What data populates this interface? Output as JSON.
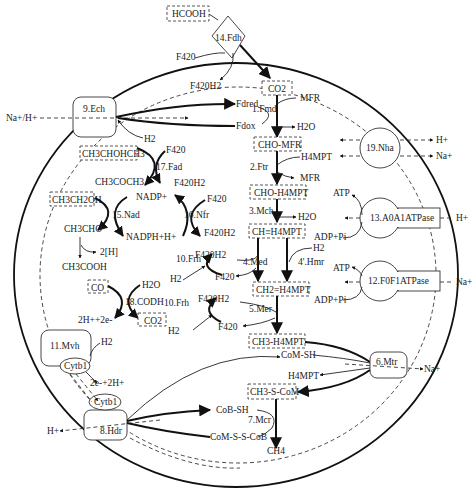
{
  "diagram": {
    "colors": {
      "line": "#111111",
      "text": "#222222",
      "background": "#ffffff"
    },
    "substrates": {
      "hcooh": "HCOOH",
      "co2_top": "CO2",
      "isopropanol": "CH3CHOHCH3",
      "ethanol": "CH3CH2OH",
      "co": "CO",
      "co2_codh": "CO2"
    },
    "enzymes": {
      "fdh": "14.Fdh",
      "ech": "9.Ech",
      "fmd": "1.Fmd",
      "ftr": "2.Ftr",
      "mch": "3.Mch",
      "med": "4.Med",
      "hmr": "4'.Hmr",
      "mer": "5.Mer",
      "mtr": "6.Mtr",
      "mcr": "7.Mcr",
      "hdr": "8.Hdr",
      "frh1": "10.Frh",
      "frh2": "10.Frh",
      "frh3": "10.Frh",
      "mvh": "11.Mvh",
      "f0f1": "12.F0F1ATPase",
      "a0a1": "13.A0A1ATPase",
      "nad": "15.Nad",
      "nfr": "16.Nfr",
      "fad": "17.Fad",
      "codh": "18.CODH",
      "nha": "19.Nha",
      "cytb_top": "Cytb1",
      "cytb_bottom": "Cytb1"
    },
    "intermediates": {
      "cho_mfr": "CHO-MFR",
      "cho_h4mpt": "CHO-H4MPT",
      "ch_h4mpt": "CH≡H4MPT",
      "ch2_h4mpt": "CH2=H4MPT",
      "ch3_h4mpt": "CH3-H4MPT",
      "ch3_s_com": "CH3-S-CoM",
      "ch4": "CH4"
    },
    "labels": {
      "f420_fdh": "F420",
      "f420h2_fdh": "F420H2",
      "fd_red": "Fdred",
      "fd_ox": "Fdox",
      "mfr_in": "MFR",
      "h2o_1": "H2O",
      "h4mpt_in": "H4MPT",
      "mfr_out": "MFR",
      "h2o_3": "H2O",
      "na_h": "Na+/H+",
      "h2_ech": "H2",
      "f420_fad": "F420",
      "f420h2_fad": "F420H2",
      "acetone": "CH3COCH3",
      "nadp": "NADP+",
      "f420_nfr": "F420",
      "f420h2_nfr": "F420H2",
      "acetaldehyde": "CH3CHO",
      "nadph": "NADPH+H+",
      "two_h": "2[H]",
      "acetate": "CH3COOH",
      "h2o_codh": "H2O",
      "electrons": "2H++2e-",
      "f420h2_frh1": "F420H2",
      "f420_frh1": "F420",
      "h2_frh1": "H2",
      "h2_hmr": "H2",
      "f420h2_frh2": "F420H2",
      "f420_frh2": "F420",
      "h2_frh2": "H2",
      "h2_mvh": "H2",
      "e_h": "2e-+2H+",
      "com_sh": "CoM-SH",
      "h4mpt_out": "H4MPT",
      "cob_sh": "CoB-SH",
      "heterodisulfide": "CoM-S-S-CoB",
      "h_out_hdr": "H+",
      "na_out_mtr": "Na+",
      "h_nha": "H+",
      "na_nha": "Na+",
      "atp_13": "ATP",
      "adp_13": "ADP+Pi",
      "h_13": "H+",
      "atp_12": "ATP",
      "adp_12": "ADP+Pi",
      "na_12": "Na+"
    }
  }
}
